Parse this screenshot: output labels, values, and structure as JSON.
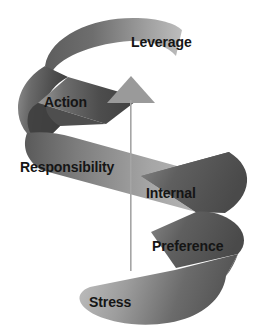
{
  "diagram": {
    "type": "ascending-spiral",
    "title": "",
    "direction": "upward",
    "arrow": {
      "name": "upward-arrow",
      "color": "#9a9a9a",
      "head_tip_x": 131,
      "head_tip_y": 76,
      "shaft_bottom_y": 271
    },
    "ribbon": {
      "color_dark": "#4a4a4a",
      "color_mid": "#7d7d7d",
      "color_light": "#b8b8b8",
      "band_count": 6
    },
    "stages": [
      {
        "id": "leverage",
        "label": "Leverage",
        "order": 6,
        "position": "top"
      },
      {
        "id": "action",
        "label": "Action",
        "order": 5,
        "position": "upper-left"
      },
      {
        "id": "responsibility",
        "label": "Responsibility",
        "order": 4,
        "position": "middle-left"
      },
      {
        "id": "internal",
        "label": "Internal",
        "order": 3,
        "position": "middle-right"
      },
      {
        "id": "preference",
        "label": "Preference",
        "order": 2,
        "position": "lower-right"
      },
      {
        "id": "stress",
        "label": "Stress",
        "order": 1,
        "position": "bottom"
      }
    ]
  }
}
